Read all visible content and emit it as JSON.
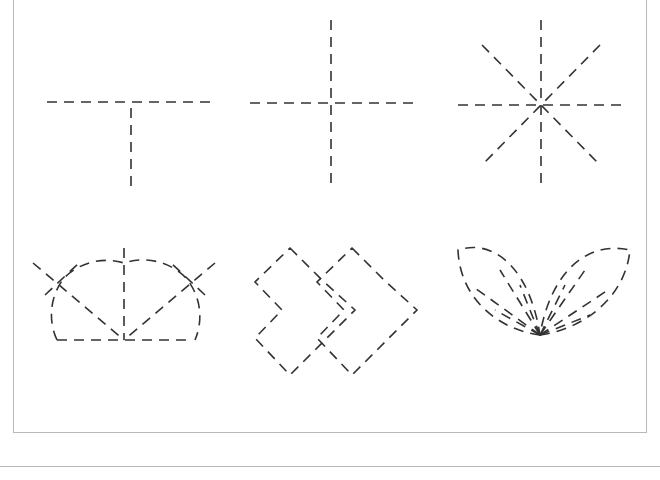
{
  "canvas": {
    "stroke_color": "#333333",
    "frame_border_color": "#b8b8b8",
    "background": "#ffffff",
    "dash_pattern": "10,7"
  },
  "shapes": [
    {
      "id": "t-junction",
      "label": "T junction",
      "row": 1,
      "col": 1
    },
    {
      "id": "cross",
      "label": "Cross",
      "row": 1,
      "col": 2
    },
    {
      "id": "starburst",
      "label": "Eight-ray starburst",
      "row": 1,
      "col": 3
    },
    {
      "id": "arch-fan",
      "label": "Semicircle with fan rays",
      "row": 2,
      "col": 1
    },
    {
      "id": "double-chevron",
      "label": "Double chevron",
      "row": 2,
      "col": 2
    },
    {
      "id": "leaf-pair",
      "label": "Pair of leaves with veins",
      "row": 2,
      "col": 3
    }
  ]
}
